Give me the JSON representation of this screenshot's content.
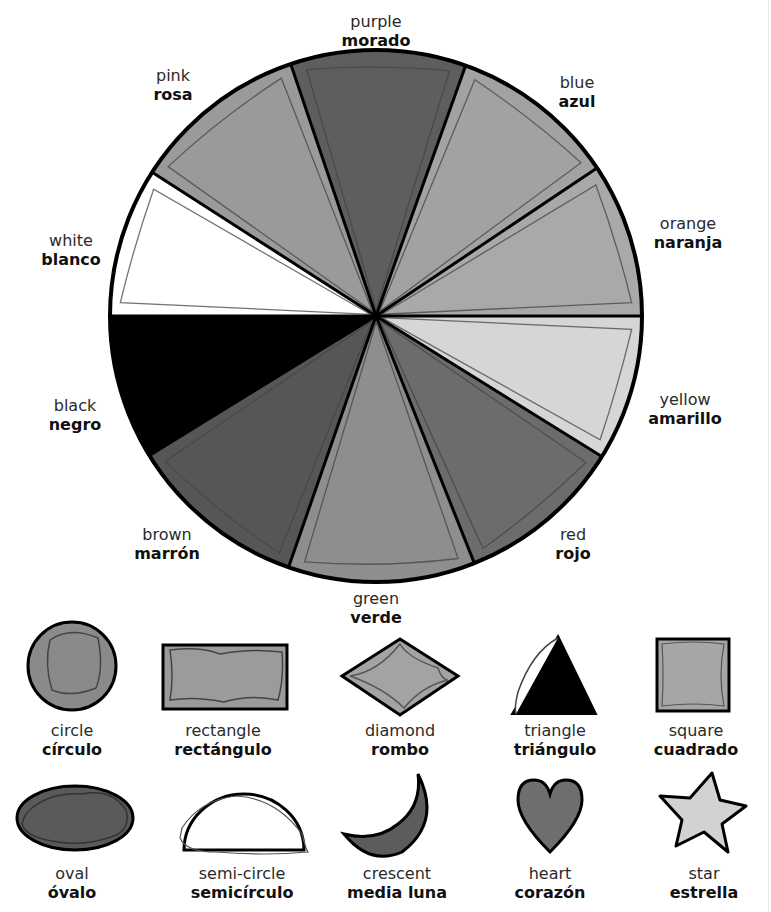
{
  "header": {
    "title_fragment": "y"
  },
  "wheel": {
    "center": [
      376,
      316
    ],
    "radius": 266,
    "segments": [
      {
        "id": "purple",
        "english": "purple",
        "spanish": "morado",
        "start_deg": 251.3,
        "end_deg": 289.7,
        "fill": "#5e5e5e"
      },
      {
        "id": "blue",
        "english": "blue",
        "spanish": "azul",
        "start_deg": 289.7,
        "end_deg": 326.2,
        "fill": "#a2a2a2"
      },
      {
        "id": "orange",
        "english": "orange",
        "spanish": "naranja",
        "start_deg": 326.2,
        "end_deg": 360,
        "fill": "#a9a9a9"
      },
      {
        "id": "yellow",
        "english": "yellow",
        "spanish": "amarillo",
        "start_deg": 0,
        "end_deg": 31.9,
        "fill": "#d6d6d6"
      },
      {
        "id": "red",
        "english": "red",
        "spanish": "rojo",
        "start_deg": 31.9,
        "end_deg": 68.3,
        "fill": "#6c6c6c"
      },
      {
        "id": "green",
        "english": "green",
        "spanish": "verde",
        "start_deg": 68.3,
        "end_deg": 109.2,
        "fill": "#8e8e8e"
      },
      {
        "id": "brown",
        "english": "brown",
        "spanish": "marrón",
        "start_deg": 109.2,
        "end_deg": 148.4,
        "fill": "#565656"
      },
      {
        "id": "black",
        "english": "black",
        "spanish": "negro",
        "start_deg": 148.4,
        "end_deg": 180,
        "fill": "#000000"
      },
      {
        "id": "white",
        "english": "white",
        "spanish": "blanco",
        "start_deg": 180,
        "end_deg": 212.7,
        "fill": "#ffffff"
      },
      {
        "id": "pink",
        "english": "pink",
        "spanish": "rosa",
        "start_deg": 212.7,
        "end_deg": 251.3,
        "fill": "#9a9a9a"
      }
    ]
  },
  "labels": {
    "purple": {
      "en": "purple",
      "es": "morado"
    },
    "blue": {
      "en": "blue",
      "es": "azul"
    },
    "orange": {
      "en": "orange",
      "es": "naranja"
    },
    "yellow": {
      "en": "yellow",
      "es": "amarillo"
    },
    "red": {
      "en": "red",
      "es": "rojo"
    },
    "green": {
      "en": "green",
      "es": "verde"
    },
    "brown": {
      "en": "brown",
      "es": "marrón"
    },
    "black": {
      "en": "black",
      "es": "negro"
    },
    "white": {
      "en": "white",
      "es": "blanco"
    },
    "pink": {
      "en": "pink",
      "es": "rosa"
    }
  },
  "shapes": {
    "row1": [
      {
        "id": "circle",
        "en": "circle",
        "es": "círculo",
        "fill": "#8a8a8a"
      },
      {
        "id": "rectangle",
        "en": "rectangle",
        "es": "rectángulo",
        "fill": "#9b9b9b"
      },
      {
        "id": "diamond",
        "en": "diamond",
        "es": "rombo",
        "fill": "#a3a3a3"
      },
      {
        "id": "triangle",
        "en": "triangle",
        "es": "triángulo",
        "fill": "#000000"
      },
      {
        "id": "square",
        "en": "square",
        "es": "cuadrado",
        "fill": "#a6a6a6"
      }
    ],
    "row2": [
      {
        "id": "oval",
        "en": "oval",
        "es": "óvalo",
        "fill": "#5a5a5a"
      },
      {
        "id": "semi-circle",
        "en": "semi-circle",
        "es": "semicírculo",
        "fill": "#ffffff"
      },
      {
        "id": "crescent",
        "en": "crescent",
        "es": "media luna",
        "fill": "#5c5c5c"
      },
      {
        "id": "heart",
        "en": "heart",
        "es": "corazón",
        "fill": "#6e6e6e"
      },
      {
        "id": "star",
        "en": "star",
        "es": "estrella",
        "fill": "#d2d2d2"
      }
    ]
  }
}
